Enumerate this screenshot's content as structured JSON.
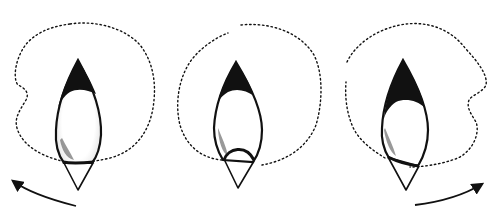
{
  "diagram": {
    "description": "Three lens-shaped figures with dotted outlines showing rotation stages",
    "figures": [
      {
        "id": "left",
        "label": "",
        "outline": "dotted-blob-left-indent",
        "band": "straight"
      },
      {
        "id": "middle",
        "label": "",
        "outline": "dotted-circle",
        "band": "arched-cap"
      },
      {
        "id": "right",
        "label": "",
        "outline": "dotted-blob-right-indent",
        "band": "tilted"
      }
    ],
    "arrows": [
      {
        "id": "left-arrow",
        "direction": "counter-clockwise"
      },
      {
        "id": "right-arrow",
        "direction": "clockwise"
      }
    ],
    "colors": {
      "ink": "#111111",
      "background": "#ffffff"
    }
  }
}
